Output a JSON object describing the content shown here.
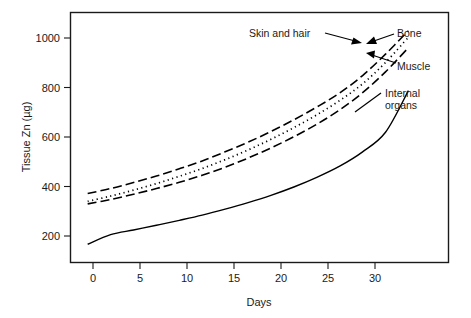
{
  "chart_data": {
    "type": "line",
    "title": "",
    "xlabel": "Days",
    "ylabel": "Tissue Zn (µg)",
    "xlim": [
      -1.5,
      31.5
    ],
    "ylim": [
      120,
      1080
    ],
    "xticks": [
      0,
      5,
      10,
      15,
      20,
      25,
      30
    ],
    "xtick_labels": [
      "0",
      "5",
      "10",
      "15",
      "20",
      "25",
      "30"
    ],
    "yticks": [
      200,
      400,
      600,
      800,
      1000
    ],
    "ytick_labels": [
      "200",
      "400",
      "600",
      "800",
      "1000"
    ],
    "grid": false,
    "legend": "none (direct annotations with arrows)",
    "x": [
      0,
      2,
      4,
      6,
      8,
      10,
      12,
      14,
      16,
      18,
      20,
      22,
      24,
      26,
      28
    ],
    "series": [
      {
        "name": "Bone",
        "style": "long-dashed",
        "values": [
          385,
          404,
          427,
          452,
          480,
          510,
          545,
          582,
          623,
          668,
          717,
          771,
          838,
          920,
          1010
        ]
      },
      {
        "name": "Skin and hair",
        "style": "dotted",
        "values": [
          355,
          375,
          398,
          423,
          451,
          481,
          515,
          552,
          593,
          638,
          687,
          742,
          806,
          888,
          985
        ]
      },
      {
        "name": "Muscle",
        "style": "long-dashed",
        "values": [
          345,
          362,
          382,
          404,
          428,
          455,
          486,
          521,
          560,
          603,
          651,
          706,
          772,
          852,
          945
        ]
      },
      {
        "name": "Internal organs",
        "style": "solid",
        "values": [
          190,
          227,
          245,
          263,
          282,
          302,
          325,
          350,
          378,
          410,
          447,
          490,
          545,
          620,
          780
        ]
      }
    ],
    "annotations": [
      {
        "id": "skin-and-hair",
        "text": "Skin and hair",
        "points_to": "Bone/Skin convergence at day ~28"
      },
      {
        "id": "bone",
        "text": "Bone",
        "points_to": "top long-dashed line at day ~28"
      },
      {
        "id": "muscle",
        "text": "Muscle",
        "points_to": "lower long-dashed line at day ~28"
      },
      {
        "id": "internal-organs",
        "text": "Internal\norgans",
        "line1": "Internal",
        "line2": "organs",
        "points_to": "solid line near day ~27"
      }
    ],
    "colors": {
      "line": "#000000",
      "axis": "#1a1a1a",
      "background": "#ffffff"
    }
  },
  "axes": {
    "x_title": "Days",
    "y_title": "Tissue Zn (µg)",
    "x_tick_labels": [
      "0",
      "5",
      "10",
      "15",
      "20",
      "25",
      "30"
    ],
    "y_tick_labels": [
      "200",
      "400",
      "600",
      "800",
      "1000"
    ]
  },
  "annotations": {
    "skin_and_hair": "Skin and hair",
    "bone": "Bone",
    "muscle": "Muscle",
    "internal_organs_line1": "Internal",
    "internal_organs_line2": "organs"
  }
}
